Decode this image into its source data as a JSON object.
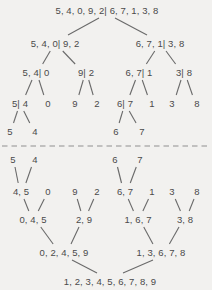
{
  "page": {
    "width": 212,
    "height": 290,
    "background": "#f2f1ef"
  },
  "diagram": {
    "type": "merge-sort-tree",
    "colors": {
      "text": "#4a4a4a",
      "edge": "#6a6a6a",
      "divider": "#8f8f8f"
    },
    "divider": {
      "style": "dashed",
      "y": 146,
      "x1": 2,
      "x2": 211,
      "dash": "5.5,4"
    },
    "split_phase": {
      "nodes": [
        {
          "id": "s0",
          "label": "5, 4, 0, 9, 2| 6, 7, 1, 3, 8",
          "x": 107,
          "y": 10
        },
        {
          "id": "s1a",
          "label": "5, 4, 0| 9, 2",
          "x": 55,
          "y": 43
        },
        {
          "id": "s1b",
          "label": "6, 7, 1| 3, 8",
          "x": 160,
          "y": 43
        },
        {
          "id": "s2a",
          "label": "5, 4| 0",
          "x": 36,
          "y": 72
        },
        {
          "id": "s2b",
          "label": "9| 2",
          "x": 86,
          "y": 72
        },
        {
          "id": "s2c",
          "label": "6, 7| 1",
          "x": 139,
          "y": 72
        },
        {
          "id": "s2d",
          "label": "3| 8",
          "x": 184,
          "y": 72
        },
        {
          "id": "s3a",
          "label": "5| 4",
          "x": 20,
          "y": 103
        },
        {
          "id": "s3b",
          "label": "0",
          "x": 48,
          "y": 103
        },
        {
          "id": "s3c",
          "label": "9",
          "x": 75,
          "y": 103
        },
        {
          "id": "s3d",
          "label": "2",
          "x": 97,
          "y": 103
        },
        {
          "id": "s3e",
          "label": "6| 7",
          "x": 125,
          "y": 103
        },
        {
          "id": "s3f",
          "label": "1",
          "x": 152,
          "y": 103
        },
        {
          "id": "s3g",
          "label": "3",
          "x": 172,
          "y": 103
        },
        {
          "id": "s3h",
          "label": "8",
          "x": 197,
          "y": 103
        },
        {
          "id": "s4a",
          "label": "5",
          "x": 10,
          "y": 131
        },
        {
          "id": "s4b",
          "label": "4",
          "x": 35,
          "y": 131
        },
        {
          "id": "s4c",
          "label": "6",
          "x": 116,
          "y": 131
        },
        {
          "id": "s4d",
          "label": "7",
          "x": 142,
          "y": 131
        }
      ],
      "edges": [
        [
          "s0",
          "s1a"
        ],
        [
          "s0",
          "s1b"
        ],
        [
          "s1a",
          "s2a"
        ],
        [
          "s1a",
          "s2b"
        ],
        [
          "s1b",
          "s2c"
        ],
        [
          "s1b",
          "s2d"
        ],
        [
          "s2a",
          "s3a"
        ],
        [
          "s2a",
          "s3b"
        ],
        [
          "s2b",
          "s3c"
        ],
        [
          "s2b",
          "s3d"
        ],
        [
          "s2c",
          "s3e"
        ],
        [
          "s2c",
          "s3f"
        ],
        [
          "s2d",
          "s3g"
        ],
        [
          "s2d",
          "s3h"
        ],
        [
          "s3a",
          "s4a"
        ],
        [
          "s3a",
          "s4b"
        ],
        [
          "s3e",
          "s4c"
        ],
        [
          "s3e",
          "s4d"
        ]
      ]
    },
    "merge_phase": {
      "nodes": [
        {
          "id": "m0a",
          "label": "5",
          "x": 13,
          "y": 159
        },
        {
          "id": "m0b",
          "label": "4",
          "x": 35,
          "y": 159
        },
        {
          "id": "m0c",
          "label": "6",
          "x": 115,
          "y": 159
        },
        {
          "id": "m0d",
          "label": "7",
          "x": 140,
          "y": 159
        },
        {
          "id": "m1a",
          "label": "4, 5",
          "x": 21,
          "y": 191
        },
        {
          "id": "m1b",
          "label": "0",
          "x": 48,
          "y": 191
        },
        {
          "id": "m1c",
          "label": "9",
          "x": 75,
          "y": 191
        },
        {
          "id": "m1d",
          "label": "2",
          "x": 97,
          "y": 191
        },
        {
          "id": "m1e",
          "label": "6, 7",
          "x": 125,
          "y": 191
        },
        {
          "id": "m1f",
          "label": "1",
          "x": 152,
          "y": 191
        },
        {
          "id": "m1g",
          "label": "3",
          "x": 172,
          "y": 191
        },
        {
          "id": "m1h",
          "label": "8",
          "x": 197,
          "y": 191
        },
        {
          "id": "m2a",
          "label": "0, 4, 5",
          "x": 33,
          "y": 219
        },
        {
          "id": "m2b",
          "label": "2, 9",
          "x": 84,
          "y": 219
        },
        {
          "id": "m2c",
          "label": "1, 6, 7",
          "x": 138,
          "y": 219
        },
        {
          "id": "m2d",
          "label": "3, 8",
          "x": 185,
          "y": 219
        },
        {
          "id": "m3a",
          "label": "0, 2, 4, 5, 9",
          "x": 64,
          "y": 252
        },
        {
          "id": "m3b",
          "label": "1, 3, 6, 7, 8",
          "x": 161,
          "y": 252
        },
        {
          "id": "m4a",
          "label": "1, 2, 3, 4, 5, 6, 7, 8, 9",
          "x": 110,
          "y": 281
        }
      ],
      "edges": [
        [
          "m0a",
          "m1a"
        ],
        [
          "m0b",
          "m1a"
        ],
        [
          "m0c",
          "m1e"
        ],
        [
          "m0d",
          "m1e"
        ],
        [
          "m1a",
          "m2a"
        ],
        [
          "m1b",
          "m2a"
        ],
        [
          "m1c",
          "m2b"
        ],
        [
          "m1d",
          "m2b"
        ],
        [
          "m1e",
          "m2c"
        ],
        [
          "m1f",
          "m2c"
        ],
        [
          "m1g",
          "m2d"
        ],
        [
          "m1h",
          "m2d"
        ],
        [
          "m2a",
          "m3a"
        ],
        [
          "m2b",
          "m3a"
        ],
        [
          "m2c",
          "m3b"
        ],
        [
          "m2d",
          "m3b"
        ],
        [
          "m3a",
          "m4a"
        ],
        [
          "m3b",
          "m4a"
        ]
      ]
    }
  }
}
